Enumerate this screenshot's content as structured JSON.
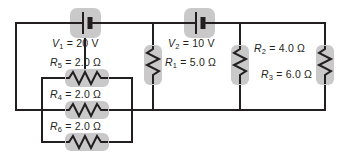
{
  "diagram": {
    "colors": {
      "wire": "#231f20",
      "component_shading": "#c9c9c9",
      "background": "#ffffff"
    },
    "sources": [
      {
        "id": "V1",
        "symbol": "battery-icon",
        "label_name": "V",
        "label_sub": "1",
        "label_eq": "=",
        "value": "20",
        "unit": "V",
        "label_full": "V1 = 20 V"
      },
      {
        "id": "V2",
        "symbol": "battery-icon",
        "label_name": "V",
        "label_sub": "2",
        "label_eq": "=",
        "value": "10",
        "unit": "V",
        "label_full": "V2 = 10 V"
      }
    ],
    "resistors": [
      {
        "id": "R1",
        "symbol": "resistor-icon",
        "orientation": "vertical",
        "label_name": "R",
        "label_sub": "1",
        "label_eq": "=",
        "value": "5.0",
        "unit": "Ω",
        "label_full": "R1 = 5.0 Ω"
      },
      {
        "id": "R2",
        "symbol": "resistor-icon",
        "orientation": "vertical",
        "label_name": "R",
        "label_sub": "2",
        "label_eq": "=",
        "value": "4.0",
        "unit": "Ω",
        "label_full": "R2 = 4.0 Ω"
      },
      {
        "id": "R3",
        "symbol": "resistor-icon",
        "orientation": "vertical",
        "label_name": "R",
        "label_sub": "3",
        "label_eq": "=",
        "value": "6.0",
        "unit": "Ω",
        "label_full": "R3 = 6.0 Ω"
      },
      {
        "id": "R4",
        "symbol": "resistor-icon",
        "orientation": "horizontal",
        "label_name": "R",
        "label_sub": "4",
        "label_eq": "=",
        "value": "2.0",
        "unit": "Ω",
        "label_full": "R4 = 2.0 Ω"
      },
      {
        "id": "R5",
        "symbol": "resistor-icon",
        "orientation": "horizontal",
        "label_name": "R",
        "label_sub": "5",
        "label_eq": "=",
        "value": "2.0",
        "unit": "Ω",
        "label_full": "R5 = 2.0 Ω"
      },
      {
        "id": "R6",
        "symbol": "resistor-icon",
        "orientation": "horizontal",
        "label_name": "R",
        "label_sub": "6",
        "label_eq": "=",
        "value": "2.0",
        "unit": "Ω",
        "label_full": "R6 = 2.0 Ω"
      }
    ]
  }
}
